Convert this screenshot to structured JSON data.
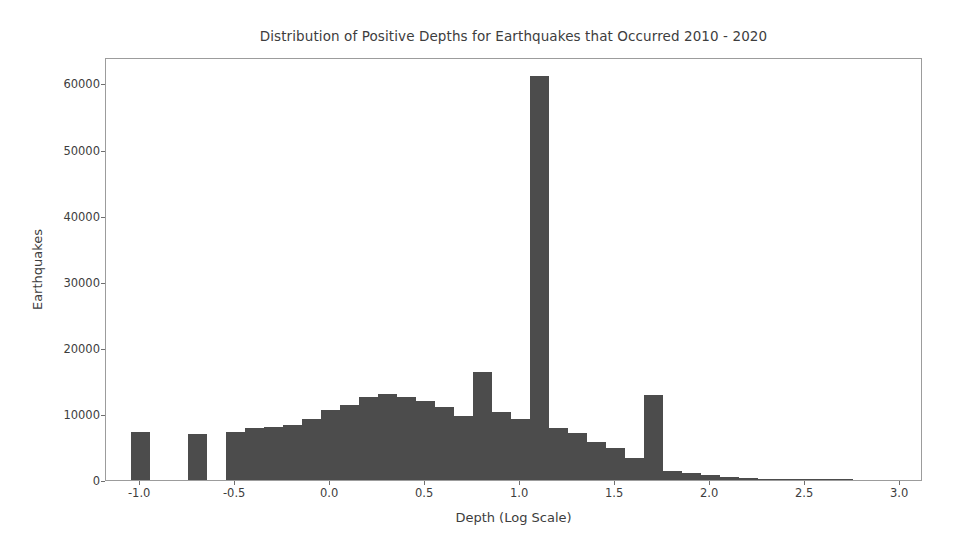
{
  "chart_data": {
    "type": "bar",
    "title": "Distribution of Positive Depths for Earthquakes that Occurred 2010 - 2020",
    "xlabel": "Depth (Log Scale)",
    "ylabel": "Earthquakes",
    "xlim": [
      -1.18,
      3.12
    ],
    "ylim": [
      0,
      64000
    ],
    "grid": false,
    "legend": null,
    "bar_color": "#4c4c4c",
    "bin_width": 0.1,
    "xticks": [
      -1.0,
      -0.5,
      0.0,
      0.5,
      1.0,
      1.5,
      2.0,
      2.5,
      3.0
    ],
    "xtick_labels": [
      "-1.0",
      "-0.5",
      "0.0",
      "0.5",
      "1.0",
      "1.5",
      "2.0",
      "2.5",
      "3.0"
    ],
    "yticks": [
      0,
      10000,
      20000,
      30000,
      40000,
      50000,
      60000
    ],
    "ytick_labels": [
      "0",
      "10000",
      "20000",
      "30000",
      "40000",
      "50000",
      "60000"
    ],
    "bin_left_edges": [
      -1.05,
      -0.95,
      -0.85,
      -0.75,
      -0.65,
      -0.55,
      -0.45,
      -0.35,
      -0.25,
      -0.15,
      -0.05,
      0.05,
      0.15,
      0.25,
      0.35,
      0.45,
      0.55,
      0.65,
      0.75,
      0.85,
      0.95,
      1.05,
      1.15,
      1.25,
      1.35,
      1.45,
      1.55,
      1.65,
      1.75,
      1.85,
      1.95,
      2.05,
      2.15,
      2.25,
      2.35,
      2.45,
      2.55,
      2.65,
      2.75,
      2.85,
      2.95,
      3.05
    ],
    "values": [
      7200,
      0,
      0,
      6900,
      0,
      7300,
      7900,
      8000,
      8300,
      9200,
      10600,
      11300,
      12600,
      13000,
      12600,
      11900,
      11100,
      9700,
      16400,
      10300,
      9300,
      61200,
      7800,
      7100,
      5800,
      4900,
      3400,
      12800,
      1400,
      1100,
      700,
      400,
      250,
      150,
      90,
      40,
      20,
      10,
      0,
      0,
      0,
      0
    ],
    "annotations": [
      {
        "text": "peak at log-depth 1.0 (~10 km)",
        "x": 1.0,
        "y": 61200
      },
      {
        "text": "secondary spike at log-depth 0.75 (~5.6 km)",
        "x": 0.8,
        "y": 16400
      },
      {
        "text": "spike at log-depth 1.55 (~35 km)",
        "x": 1.6,
        "y": 12800
      }
    ]
  }
}
